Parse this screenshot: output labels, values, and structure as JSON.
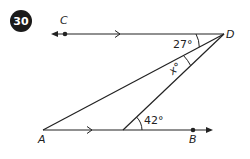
{
  "problem": {
    "number": "30"
  },
  "points": {
    "A": "A",
    "B": "B",
    "C": "C",
    "D": "D"
  },
  "angles": {
    "cdx_label": "27°",
    "x_label": "x°",
    "at_bottom_label": "42°"
  },
  "colors": {
    "line": "#222222",
    "badge": "#1a1a1a",
    "background": "#ffffff"
  }
}
